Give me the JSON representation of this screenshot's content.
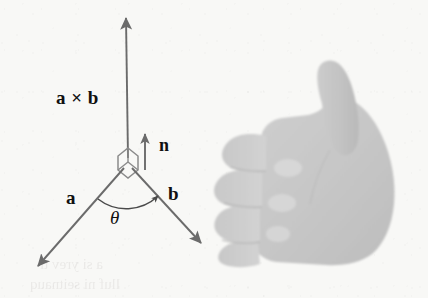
{
  "figure": {
    "background_color": "#f8f8f6",
    "ink_color": "#6b6b6b",
    "text_color": "#101010",
    "hand_color": "#c9c9c9"
  },
  "labels": {
    "cross_product": "a × b",
    "normal": "n",
    "vector_a": "a",
    "vector_b": "b",
    "angle": "θ"
  },
  "icons": {
    "cross_product_arrow": "up-arrow-icon",
    "normal_arrow": "short-up-arrow-icon",
    "vector_a_arrow": "down-left-arrow-icon",
    "vector_b_arrow": "down-right-arrow-icon",
    "angle_arc": "angle-arc-icon",
    "vertex_marker": "parallelogram-vertex-icon",
    "hand": "thumbs-up-hand-icon"
  },
  "bleed_through": {
    "line_1": "a si yrev ti",
    "line_2": "lluf ni seitnauq"
  },
  "geometry": {
    "origin": {
      "x": 128,
      "y": 160
    },
    "cross_product_arrow": {
      "x1": 128,
      "y1": 158,
      "x2": 126,
      "y2": 14
    },
    "normal_arrow": {
      "x1": 145,
      "y1": 168,
      "x2": 145,
      "y2": 130
    },
    "vector_a_arrow": {
      "x1": 126,
      "y1": 166,
      "x2": 33,
      "y2": 272
    },
    "vector_b_arrow": {
      "x1": 130,
      "y1": 166,
      "x2": 206,
      "y2": 248
    },
    "angle_value_deg": null
  }
}
